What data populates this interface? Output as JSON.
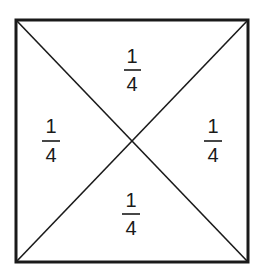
{
  "diagram": {
    "colors": {
      "line": "#1a1a1a",
      "background": "#ffffff"
    },
    "square": {
      "x1": 16,
      "y1": 20,
      "x2": 248,
      "y2": 262
    },
    "regions": [
      {
        "id": "top",
        "numerator": "1",
        "denominator": "4",
        "cx": 132,
        "numY": 63,
        "barY": 70,
        "denY": 91
      },
      {
        "id": "left",
        "numerator": "1",
        "denominator": "4",
        "cx": 51,
        "numY": 133,
        "barY": 141,
        "denY": 162
      },
      {
        "id": "right",
        "numerator": "1",
        "denominator": "4",
        "cx": 213,
        "numY": 133,
        "barY": 141,
        "denY": 162
      },
      {
        "id": "bottom",
        "numerator": "1",
        "denominator": "4",
        "cx": 131,
        "numY": 207,
        "barY": 214,
        "denY": 235
      }
    ]
  }
}
